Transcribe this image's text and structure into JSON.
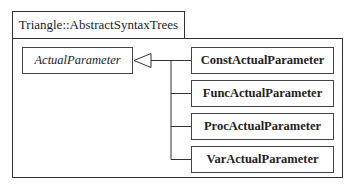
{
  "package": {
    "name": "Triangle::AbstractSyntaxTrees"
  },
  "superclass": {
    "name": "ActualParameter",
    "abstract": true
  },
  "subclasses": [
    {
      "name": "ConstActualParameter"
    },
    {
      "name": "FuncActualParameter"
    },
    {
      "name": "ProcActualParameter"
    },
    {
      "name": "VarActualParameter"
    }
  ],
  "relationship": "generalization",
  "colors": {
    "line": "#333333",
    "background": "#ffffff"
  }
}
